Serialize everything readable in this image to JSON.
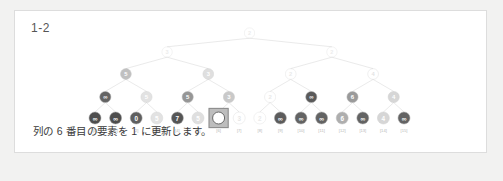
{
  "card": {
    "title": "1-2",
    "caption": "列の 6 番目の要素を 1 に更新します。",
    "background": "#ffffff",
    "border_color": "#dddddd",
    "page_background": "#f2f2f1"
  },
  "tree": {
    "type": "segment-tree",
    "leaf_count": 16,
    "levels": 5,
    "highlight_index": 6,
    "highlight_box_color": "#8c8c8c",
    "highlight_fill": "#ffffff",
    "edge_color": "#d8d8d8",
    "index_labels": [
      "[0]",
      "[1]",
      "[2]",
      "[3]",
      "[4]",
      "[5]",
      "[6]",
      "[7]",
      "[8]",
      "[9]",
      "[10]",
      "[11]",
      "[12]",
      "[13]",
      "[14]",
      "[15]"
    ],
    "levels_data": [
      {
        "level": 0,
        "name": "root",
        "nodes": [
          {
            "value": "2",
            "opacity": 0.22,
            "fill": "#ffffff",
            "text_color": "#a8a8a8"
          }
        ]
      },
      {
        "level": 1,
        "nodes": [
          {
            "value": "3",
            "opacity": 0.22,
            "fill": "#ffffff",
            "text_color": "#a8a8a8"
          },
          {
            "value": "2",
            "opacity": 0.22,
            "fill": "#ffffff",
            "text_color": "#a8a8a8"
          }
        ]
      },
      {
        "level": 2,
        "nodes": [
          {
            "value": "5",
            "opacity": 0.55,
            "fill": "#8e8e8e",
            "text_color": "#ffffff"
          },
          {
            "value": "3",
            "opacity": 0.4,
            "fill": "#b0b0b0",
            "text_color": "#ffffff"
          },
          {
            "value": "2",
            "opacity": 0.25,
            "fill": "#ffffff",
            "text_color": "#a8a8a8"
          },
          {
            "value": "4",
            "opacity": 0.3,
            "fill": "#ffffff",
            "text_color": "#a0a0a0"
          }
        ]
      },
      {
        "level": 3,
        "nodes": [
          {
            "value": "∞",
            "opacity": 0.85,
            "fill": "#4a4a4a",
            "text_color": "#ffffff"
          },
          {
            "value": "5",
            "opacity": 0.38,
            "fill": "#b4b4b4",
            "text_color": "#ffffff"
          },
          {
            "value": "5",
            "opacity": 0.72,
            "fill": "#6e6e6e",
            "text_color": "#ffffff"
          },
          {
            "value": "3",
            "opacity": 0.52,
            "fill": "#999999",
            "text_color": "#ffffff"
          },
          {
            "value": "2",
            "opacity": 0.26,
            "fill": "#ffffff",
            "text_color": "#a8a8a8"
          },
          {
            "value": "∞",
            "opacity": 0.88,
            "fill": "#444444",
            "text_color": "#ffffff"
          },
          {
            "value": "6",
            "opacity": 0.7,
            "fill": "#707070",
            "text_color": "#ffffff"
          },
          {
            "value": "4",
            "opacity": 0.45,
            "fill": "#a6a6a6",
            "text_color": "#ffffff"
          }
        ]
      },
      {
        "level": 4,
        "name": "leaves",
        "nodes": [
          {
            "value": "∞",
            "opacity": 0.92,
            "fill": "#3f3f3f",
            "text_color": "#ffffff"
          },
          {
            "value": "∞",
            "opacity": 0.92,
            "fill": "#3f3f3f",
            "text_color": "#ffffff"
          },
          {
            "value": "0",
            "opacity": 0.88,
            "fill": "#4a4a4a",
            "text_color": "#ffffff"
          },
          {
            "value": "5",
            "opacity": 0.38,
            "fill": "#b4b4b4",
            "text_color": "#ffffff"
          },
          {
            "value": "7",
            "opacity": 0.9,
            "fill": "#434343",
            "text_color": "#ffffff"
          },
          {
            "value": "5",
            "opacity": 0.4,
            "fill": "#b0b0b0",
            "text_color": "#ffffff"
          },
          {
            "value": "",
            "opacity": 1.0,
            "fill": "#ffffff",
            "text_color": "#ffffff",
            "highlighted": true
          },
          {
            "value": "3",
            "opacity": 0.28,
            "fill": "#ffffff",
            "text_color": "#a8a8a8"
          },
          {
            "value": "2",
            "opacity": 0.24,
            "fill": "#ffffff",
            "text_color": "#a8a8a8"
          },
          {
            "value": "∞",
            "opacity": 0.88,
            "fill": "#464646",
            "text_color": "#ffffff"
          },
          {
            "value": "∞",
            "opacity": 0.86,
            "fill": "#4a4a4a",
            "text_color": "#ffffff"
          },
          {
            "value": "∞",
            "opacity": 0.86,
            "fill": "#4a4a4a",
            "text_color": "#ffffff"
          },
          {
            "value": "6",
            "opacity": 0.62,
            "fill": "#7e7e7e",
            "text_color": "#ffffff"
          },
          {
            "value": "∞",
            "opacity": 0.86,
            "fill": "#4a4a4a",
            "text_color": "#ffffff"
          },
          {
            "value": "4",
            "opacity": 0.45,
            "fill": "#a6a6a6",
            "text_color": "#ffffff"
          },
          {
            "value": "∞",
            "opacity": 0.86,
            "fill": "#4a4a4a",
            "text_color": "#ffffff"
          }
        ]
      }
    ]
  }
}
